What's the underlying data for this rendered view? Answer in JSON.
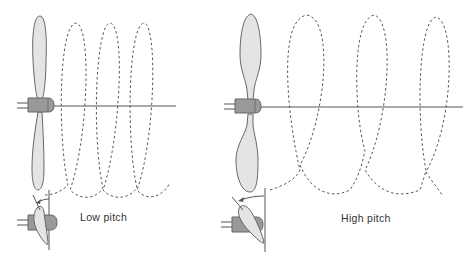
{
  "diagram": {
    "panels": [
      {
        "id": "low",
        "label": "Low pitch"
      },
      {
        "id": "high",
        "label": "High pitch"
      }
    ],
    "colors": {
      "blade_fill": "#e4e4e4",
      "blade_stroke": "#666666",
      "hub_fill": "#999999",
      "line": "#555555",
      "helix": "#555555"
    }
  }
}
